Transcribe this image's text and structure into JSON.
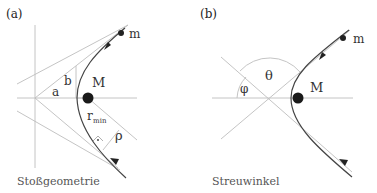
{
  "panels": [
    {
      "id": "a",
      "label": "(a)",
      "caption": "Stoßgeometrie",
      "labels": {
        "mass_small": "m",
        "mass_large": "M",
        "a": "a",
        "b": "b",
        "r": "r",
        "r_sub": "min",
        "rho": "ρ"
      }
    },
    {
      "id": "b",
      "label": "(b)",
      "caption": "Streuwinkel",
      "labels": {
        "mass_small": "m",
        "mass_large": "M",
        "theta": "θ",
        "phi": "φ"
      }
    }
  ],
  "colors": {
    "guide_line": "#b8b8b8",
    "trajectory": "#444444",
    "mass": "#1a1a1a"
  }
}
